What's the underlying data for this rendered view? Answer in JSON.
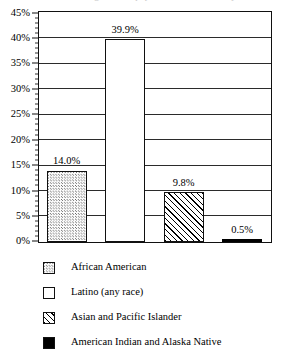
{
  "chart_data": {
    "type": "bar",
    "title": "Percentage of U.S. population that is minority",
    "xlabel": "",
    "ylabel": "",
    "ylim": [
      0,
      45
    ],
    "ytick_step": 5,
    "yticks": [
      "0%",
      "5%",
      "10%",
      "15%",
      "20%",
      "25%",
      "30%",
      "35%",
      "40%",
      "45%"
    ],
    "grid": true,
    "legend_position": "below",
    "minor_ticks": true,
    "categories": [
      "African American",
      "Latino (any race)",
      "Asian and Pacific Islander",
      "American Indian and Alaska Native"
    ],
    "values": [
      14.0,
      39.9,
      9.8,
      0.5
    ],
    "data_labels": [
      "14.0%",
      "39.9%",
      "9.8%",
      "0.5%"
    ],
    "bars": [
      {
        "label": "African American",
        "value": 14.0,
        "data_label": "14.0%",
        "fill": "stipple"
      },
      {
        "label": "Latino (any race)",
        "value": 39.9,
        "data_label": "39.9%",
        "fill": "white"
      },
      {
        "label": "Asian and Pacific Islander",
        "value": 9.8,
        "data_label": "9.8%",
        "fill": "hatch"
      },
      {
        "label": "American Indian and Alaska Native",
        "value": 0.5,
        "data_label": "0.5%",
        "fill": "solid"
      }
    ],
    "legend": [
      {
        "label": "African American",
        "fill": "stipple"
      },
      {
        "label": "Latino (any race)",
        "fill": "white"
      },
      {
        "label": "Asian and Pacific Islander",
        "fill": "hatch"
      },
      {
        "label": "American Indian and Alaska Native",
        "fill": "solid"
      }
    ],
    "colors": {
      "axis": "#111111",
      "gridline": "#2b2b2b",
      "bar_outline": "#111111",
      "solid_bar": "#000000",
      "background": "#ffffff"
    }
  }
}
